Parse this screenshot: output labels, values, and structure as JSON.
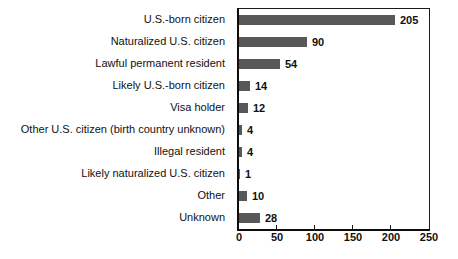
{
  "chart_data": {
    "type": "bar",
    "orientation": "horizontal",
    "title": "",
    "xlabel": "",
    "ylabel": "",
    "categories": [
      "U.S.-born citizen",
      "Naturalized U.S. citizen",
      "Lawful permanent resident",
      "Likely U.S.-born citizen",
      "Visa holder",
      "Other U.S. citizen (birth country unknown)",
      "Illegal resident",
      "Likely naturalized U.S. citizen",
      "Other",
      "Unknown"
    ],
    "values": [
      205,
      90,
      54,
      14,
      12,
      4,
      4,
      1,
      10,
      28
    ],
    "xlim": [
      0,
      250
    ],
    "xticks": [
      0,
      50,
      100,
      150,
      200,
      250
    ],
    "grid": false,
    "legend": "none",
    "data_labels": true,
    "bar_color": "#57585a",
    "axis_color": "#0d0d0d",
    "background_color": "#ffffff"
  }
}
